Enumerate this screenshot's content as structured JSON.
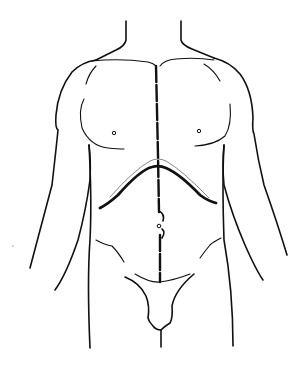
{
  "figure": {
    "annotations": [
      {
        "name": "midline-incision",
        "style": "dashed",
        "extent": "xiphoid to pubis"
      },
      {
        "name": "bilateral-subcostal-incision",
        "style": "thick solid curve",
        "shape": "chevron along costal margin"
      },
      {
        "name": "umbilicus"
      }
    ],
    "colors": {
      "line": "#111111",
      "background": "#ffffff",
      "secondary_line": "#777777"
    }
  }
}
